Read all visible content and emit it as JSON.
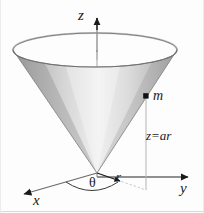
{
  "figure": {
    "axes": {
      "z": "z",
      "y": "y",
      "x": "x"
    },
    "labels": {
      "radius": "r",
      "angle": "θ",
      "mass": "m",
      "surface_equation": "z=ar"
    },
    "colors": {
      "ink": "#1a1a1a",
      "axis": "#555555",
      "cone_light": "#f2f2f2",
      "cone_mid": "#c9c9c9",
      "cone_dark": "#8d8d8d",
      "rim": "#6f6f6f",
      "guide": "#b9b9b9",
      "background": "#fdfdfd"
    },
    "geometry": {
      "apex": [
        97,
        173
      ],
      "rim_center": [
        95,
        50
      ],
      "rim_rx": 82,
      "rim_ry": 17,
      "mass_point": [
        146,
        96
      ],
      "z_arrow_tip": [
        97,
        8
      ],
      "y_arrow_tip": [
        196,
        177
      ],
      "x_arrow_tip": [
        14,
        196
      ]
    }
  }
}
